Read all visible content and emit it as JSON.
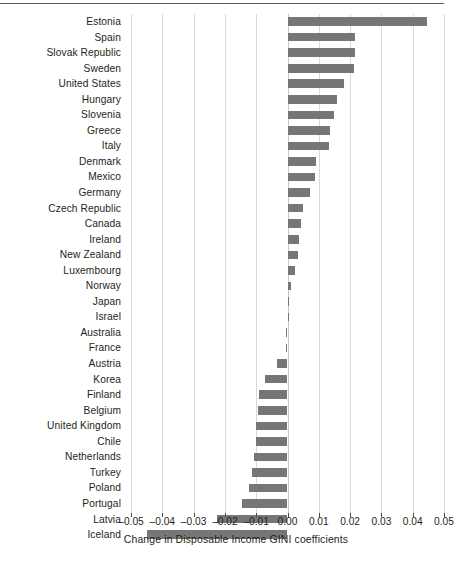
{
  "chart_data": {
    "type": "bar",
    "orientation": "horizontal",
    "title": "",
    "xlabel": "Change in Disposable Income GINI coefficients",
    "ylabel": "",
    "xlim": [
      -0.05,
      0.05
    ],
    "xticks": [
      -0.05,
      -0.04,
      -0.03,
      -0.02,
      -0.01,
      0.0,
      0.01,
      0.02,
      0.03,
      0.04,
      0.05
    ],
    "xticklabels": [
      "–0.05",
      "–0.04",
      "–0.03",
      "–0.02",
      "–0.01",
      "0.00",
      "0.01",
      "0.02",
      "0.03",
      "0.04",
      "0.05"
    ],
    "grid": true,
    "grid_axis": "x",
    "legend": false,
    "bar_color": "#767676",
    "categories": [
      "Estonia",
      "Spain",
      "Slovak Republic",
      "Sweden",
      "United States",
      "Hungary",
      "Slovenia",
      "Greece",
      "Italy",
      "Denmark",
      "Mexico",
      "Germany",
      "Czech Republic",
      "Canada",
      "Ireland",
      "New Zealand",
      "Luxembourg",
      "Norway",
      "Japan",
      "Israel",
      "Australia",
      "France",
      "Austria",
      "Korea",
      "Finland",
      "Belgium",
      "United Kingdom",
      "Chile",
      "Netherlands",
      "Turkey",
      "Poland",
      "Portugal",
      "Latvia",
      "Iceland"
    ],
    "values": [
      0.0445,
      0.0215,
      0.0215,
      0.0212,
      0.018,
      0.0158,
      0.015,
      0.0135,
      0.0133,
      0.0092,
      0.0088,
      0.0072,
      0.0048,
      0.0042,
      0.0038,
      0.0035,
      0.0025,
      0.0012,
      0.0004,
      0.0,
      -0.0004,
      -0.0005,
      -0.0035,
      -0.0072,
      -0.009,
      -0.0095,
      -0.01,
      -0.0102,
      -0.0108,
      -0.0115,
      -0.0122,
      -0.0145,
      -0.0225,
      -0.0448
    ]
  },
  "axis": {
    "x_label_text": "Change in Disposable Income GINI coefficients"
  }
}
